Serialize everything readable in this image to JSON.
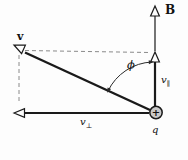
{
  "diagram": {
    "labels": {
      "field": "B",
      "velocity": "v",
      "component_base": "v",
      "parallel_subscript": "∥",
      "perpendicular_subscript": "⊥",
      "angle": "ϕ",
      "charge": "q",
      "charge_sign": "+"
    },
    "colors": {
      "stroke": "#1a1a1a",
      "guide_dashed": "#8a8a8a",
      "charge_fill": "#c9c9c9",
      "background": "#fdfdfd"
    }
  }
}
